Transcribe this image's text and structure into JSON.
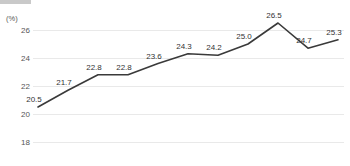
{
  "chart_data": {
    "type": "line",
    "title": "",
    "subtitle": "",
    "xlabel": "",
    "ylabel": "(%)",
    "unit_label": "(%)",
    "ylim": [
      17,
      27
    ],
    "yticks": [
      26,
      24,
      22,
      20,
      18
    ],
    "ytick_labels": [
      "26",
      "24",
      "22",
      "20",
      "18"
    ],
    "partial_ytick_label": "16",
    "grid": true,
    "grid_axis": "y",
    "legend": "none",
    "legend_position": "none",
    "categories": [
      "1",
      "2",
      "3",
      "4",
      "5",
      "6",
      "7",
      "8",
      "9",
      "10",
      "11"
    ],
    "x": [
      1,
      2,
      3,
      4,
      5,
      6,
      7,
      8,
      9,
      10,
      11
    ],
    "values": [
      20.5,
      21.7,
      22.8,
      22.8,
      23.6,
      24.3,
      24.2,
      25.0,
      26.5,
      24.7,
      25.3
    ],
    "data_labels": [
      "20.5",
      "21.7",
      "22.8",
      "22.8",
      "23.6",
      "24.3",
      "24.2",
      "25.0",
      "26.5",
      "24.7",
      "25.3"
    ],
    "series": [
      {
        "name": "",
        "values": [
          20.5,
          21.7,
          22.8,
          22.8,
          23.6,
          24.3,
          24.2,
          25.0,
          26.5,
          24.7,
          25.3
        ]
      }
    ],
    "line_color": "#3a3a3a",
    "grid_color": "#e9e9e9",
    "label_color": "#333333",
    "axis_text_color": "#555555",
    "markers": false
  },
  "xaxis_cropped_labels": [
    "",
    "",
    "",
    "",
    "",
    "",
    "",
    "",
    "",
    "",
    ""
  ]
}
